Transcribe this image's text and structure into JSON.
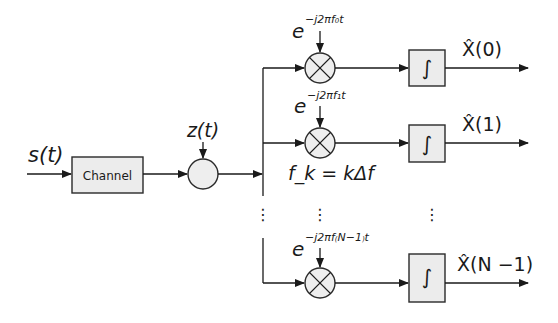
{
  "diagram": {
    "input_label": "s(t)",
    "channel_label": "Channel",
    "noise_label": "z(t)",
    "frequency_relation": "f_k = kΔf",
    "branches": [
      {
        "oscillator_base": "e",
        "oscillator_exponent": "−j2πf₀t",
        "integrator_symbol": "∫",
        "output_label": "X̂(0)"
      },
      {
        "oscillator_base": "e",
        "oscillator_exponent": "−j2πf₁t",
        "integrator_symbol": "∫",
        "output_label": "X̂(1)"
      },
      {
        "oscillator_base": "e",
        "oscillator_exponent": "−j2πf₍N−1₎t",
        "integrator_symbol": "∫",
        "output_label": "X̂(N −1)"
      }
    ],
    "ellipsis": "⋮"
  }
}
